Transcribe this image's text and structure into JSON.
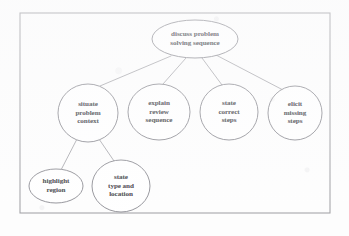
{
  "diagram": {
    "type": "hierarchical-tree",
    "title": "discuss problem solving sequence",
    "frame": {
      "x": 20,
      "y": 13,
      "width": 310,
      "height": 200,
      "stroke": "#8a8a90"
    },
    "colors": {
      "node_stroke": "#6f6f77",
      "edge_stroke": "#86868e",
      "text": "#24242a",
      "background": "#fdfdfd",
      "frame": "#8a8a90"
    },
    "nodes": [
      {
        "id": "root",
        "label": "discuss problem\nsolving sequence",
        "shape": "ellipse",
        "cx": 195,
        "cy": 39,
        "rx": 43,
        "ry": 19,
        "level": 0
      },
      {
        "id": "situate",
        "label": "situate\nproblem\ncontext",
        "shape": "ellipse",
        "cx": 88,
        "cy": 113,
        "rx": 30,
        "ry": 29,
        "level": 1
      },
      {
        "id": "explain",
        "label": "explain\nreview\nsequence",
        "shape": "ellipse",
        "cx": 159,
        "cy": 112,
        "rx": 31,
        "ry": 28,
        "level": 1
      },
      {
        "id": "correct",
        "label": "state\ncorrect\nsteps",
        "shape": "ellipse",
        "cx": 229,
        "cy": 112,
        "rx": 29,
        "ry": 28,
        "level": 1
      },
      {
        "id": "elicit",
        "label": "elicit\nmissing\nsteps",
        "shape": "ellipse",
        "cx": 295,
        "cy": 113,
        "rx": 27,
        "ry": 27,
        "level": 1
      },
      {
        "id": "highlight",
        "label": "highlight\nregion",
        "shape": "ellipse",
        "cx": 56,
        "cy": 186,
        "rx": 27,
        "ry": 17,
        "level": 2
      },
      {
        "id": "statetype",
        "label": "state\ntype and\nlocation",
        "shape": "ellipse",
        "cx": 121,
        "cy": 186,
        "rx": 29,
        "ry": 26,
        "level": 2
      }
    ],
    "edges": [
      {
        "id": "root-situate",
        "from": "root",
        "to": "situate",
        "x1": 171,
        "y1": 56,
        "x2": 100,
        "y2": 86
      },
      {
        "id": "root-explain",
        "from": "root",
        "to": "explain",
        "x1": 186,
        "y1": 58,
        "x2": 163,
        "y2": 84
      },
      {
        "id": "root-correct",
        "from": "root",
        "to": "correct",
        "x1": 202,
        "y1": 58,
        "x2": 222,
        "y2": 85
      },
      {
        "id": "root-elicit",
        "from": "root",
        "to": "elicit",
        "x1": 216,
        "y1": 55,
        "x2": 283,
        "y2": 90
      },
      {
        "id": "situate-highlight",
        "from": "situate",
        "to": "highlight",
        "x1": 77,
        "y1": 139,
        "x2": 61,
        "y2": 170
      },
      {
        "id": "situate-statetype",
        "from": "situate",
        "to": "statetype",
        "x1": 99,
        "y1": 139,
        "x2": 114,
        "y2": 161
      }
    ]
  }
}
